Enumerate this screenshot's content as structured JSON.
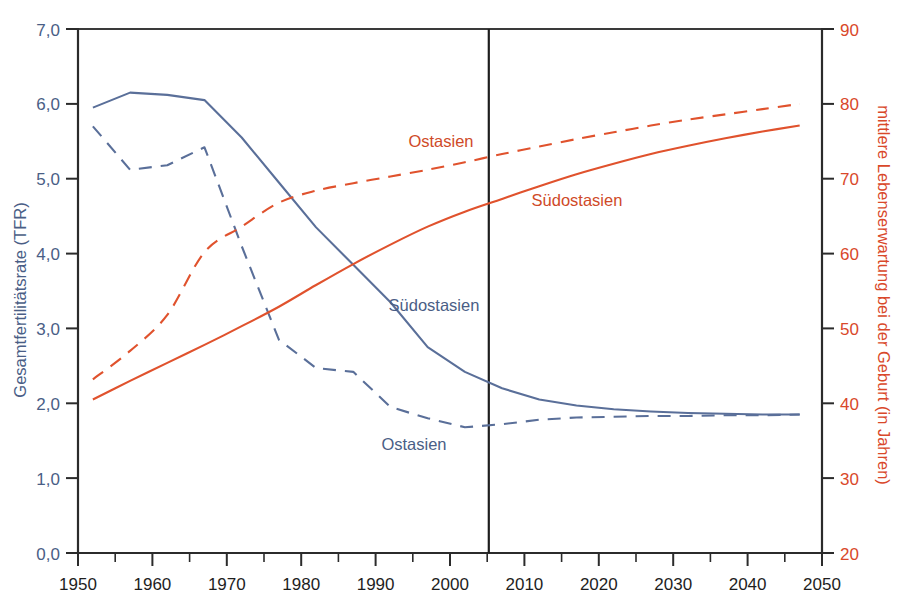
{
  "chart_data": {
    "type": "line",
    "title": "",
    "xlabel": "",
    "xlim": [
      1950,
      2050
    ],
    "xticks": [
      1950,
      1960,
      1970,
      1980,
      1990,
      2000,
      2010,
      2020,
      2030,
      2040,
      2050
    ],
    "xtick_labels": [
      "1950",
      "1960",
      "1970",
      "1980",
      "1990",
      "2000",
      "2010",
      "2020",
      "2030",
      "2040",
      "2050"
    ],
    "x_minor_ticks": [
      1955,
      1965,
      1975,
      1985,
      1995,
      2005,
      2015,
      2025,
      2035,
      2045
    ],
    "grid": false,
    "legend_position": "inline-annotations",
    "left_axis": {
      "label": "Gesamtfertilitätsrate (TFR)",
      "color": "#4a5e86",
      "ylim": [
        0.0,
        7.0
      ],
      "ticks": [
        0.0,
        1.0,
        2.0,
        3.0,
        4.0,
        5.0,
        6.0,
        7.0
      ],
      "tick_labels": [
        "0,0",
        "1,0",
        "2,0",
        "3,0",
        "4,0",
        "5,0",
        "6,0",
        "7,0"
      ]
    },
    "right_axis": {
      "label": "mittlere Lebenserwartung bei der Geburt (in Jahren)",
      "color": "#d9482a",
      "ylim": [
        20,
        90
      ],
      "ticks": [
        20,
        30,
        40,
        50,
        60,
        70,
        80,
        90
      ],
      "tick_labels": [
        "20",
        "30",
        "40",
        "50",
        "60",
        "70",
        "80",
        "90"
      ]
    },
    "divider_year": 2005,
    "series": [
      {
        "name": "Südostasien",
        "metric": "Gesamtfertilitätsrate (TFR)",
        "axis": "left",
        "color": "#5a6f99",
        "style": "solid",
        "annotation_label": "Südostasien",
        "x": [
          1952,
          1957,
          1962,
          1967,
          1972,
          1977,
          1982,
          1987,
          1992,
          1997,
          2002,
          2007,
          2012,
          2017,
          2022,
          2027,
          2032,
          2037,
          2042,
          2047
        ],
        "values": [
          5.95,
          6.15,
          6.12,
          6.05,
          5.55,
          4.95,
          4.35,
          3.85,
          3.35,
          2.75,
          2.42,
          2.2,
          2.05,
          1.97,
          1.92,
          1.89,
          1.87,
          1.86,
          1.85,
          1.85
        ]
      },
      {
        "name": "Ostasien",
        "metric": "Gesamtfertilitätsrate (TFR)",
        "axis": "left",
        "color": "#5a6f99",
        "style": "dashed",
        "annotation_label": "Ostasien",
        "x": [
          1952,
          1957,
          1962,
          1967,
          1972,
          1977,
          1982,
          1987,
          1992,
          1997,
          2002,
          2007,
          2012,
          2017,
          2022,
          2027,
          2032,
          2037,
          2042,
          2047
        ],
        "values": [
          5.7,
          5.12,
          5.18,
          5.42,
          4.1,
          2.85,
          2.47,
          2.42,
          1.95,
          1.8,
          1.68,
          1.72,
          1.78,
          1.81,
          1.82,
          1.83,
          1.83,
          1.84,
          1.84,
          1.85
        ]
      },
      {
        "name": "Südostasien",
        "metric": "mittlere Lebenserwartung bei der Geburt (in Jahren)",
        "axis": "right",
        "color": "#e0522d",
        "style": "solid",
        "annotation_label": "Südostasien",
        "x": [
          1952,
          1957,
          1962,
          1967,
          1972,
          1977,
          1982,
          1987,
          1992,
          1997,
          2002,
          2007,
          2012,
          2017,
          2022,
          2027,
          2032,
          2037,
          2042,
          2047
        ],
        "values": [
          40.5,
          43.0,
          45.4,
          47.8,
          50.3,
          52.9,
          55.8,
          58.6,
          61.2,
          63.6,
          65.6,
          67.3,
          69.0,
          70.6,
          72.0,
          73.3,
          74.4,
          75.4,
          76.3,
          77.1
        ]
      },
      {
        "name": "Ostasien",
        "metric": "mittlere Lebenserwartung bei der Geburt (in Jahren)",
        "axis": "right",
        "color": "#e0522d",
        "style": "dashed",
        "annotation_label": "Ostasien",
        "x": [
          1952,
          1957,
          1962,
          1967,
          1972,
          1977,
          1982,
          1987,
          1992,
          1997,
          2002,
          2007,
          2012,
          2017,
          2022,
          2027,
          2032,
          2037,
          2042,
          2047
        ],
        "values": [
          43.2,
          47.0,
          51.8,
          60.2,
          63.6,
          66.8,
          68.4,
          69.4,
          70.3,
          71.2,
          72.2,
          73.3,
          74.3,
          75.3,
          76.2,
          77.1,
          77.9,
          78.6,
          79.3,
          80.0
        ]
      }
    ],
    "annotations": [
      {
        "text": "Ostasien",
        "color": "#cf4a28",
        "series": "Ostasien-life-expectancy"
      },
      {
        "text": "Südostasien",
        "color": "#cf4a28",
        "series": "Suedostasien-life-expectancy"
      },
      {
        "text": "Südostasien",
        "color": "#4a5e86",
        "series": "Suedostasien-tfr"
      },
      {
        "text": "Ostasien",
        "color": "#4a5e86",
        "series": "Ostasien-tfr"
      }
    ]
  }
}
